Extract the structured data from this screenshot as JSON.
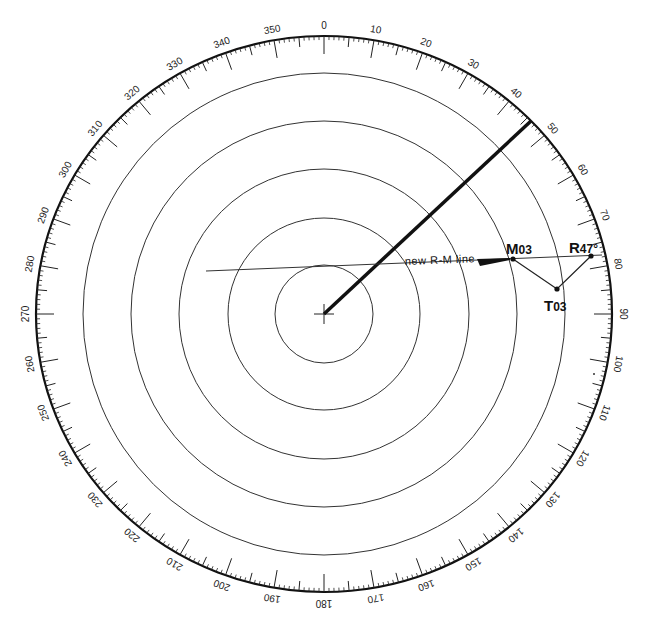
{
  "diagram": {
    "type": "radar-plotting-sheet",
    "center": {
      "x": 324,
      "y": 314
    },
    "outer_radius": {
      "rx": 288,
      "ry": 278
    },
    "range_rings": [
      49,
      96,
      145,
      193,
      241
    ],
    "bearing_labels": [
      "0",
      "10",
      "20",
      "30",
      "40",
      "50",
      "60",
      "70",
      "80",
      "90",
      "100",
      "110",
      "120",
      "130",
      "140",
      "150",
      "160",
      "170",
      "180",
      "190",
      "200",
      "210",
      "220",
      "230",
      "240",
      "250",
      "260",
      "270",
      "280",
      "290",
      "300",
      "310",
      "320",
      "330",
      "340",
      "350"
    ],
    "heading_line": {
      "bearing_deg": 47,
      "from": {
        "x": 324,
        "y": 314
      },
      "to": {
        "x": 531,
        "y": 121
      }
    },
    "rm_line": {
      "label": "new  R-M  line",
      "from": {
        "x": 206,
        "y": 271
      },
      "to": {
        "x": 602,
        "y": 255
      }
    },
    "points": [
      {
        "id": "M03",
        "label_main": "M",
        "label_sub": "03",
        "x": 513,
        "y": 259
      },
      {
        "id": "T03",
        "label_main": "T",
        "label_sub": "03",
        "x": 557,
        "y": 289
      },
      {
        "id": "R47",
        "label_main": "R",
        "label_sub": "47°",
        "x": 591,
        "y": 256
      }
    ],
    "colors": {
      "ink": "#111111",
      "rings": "#333333",
      "background": "#ffffff"
    }
  }
}
